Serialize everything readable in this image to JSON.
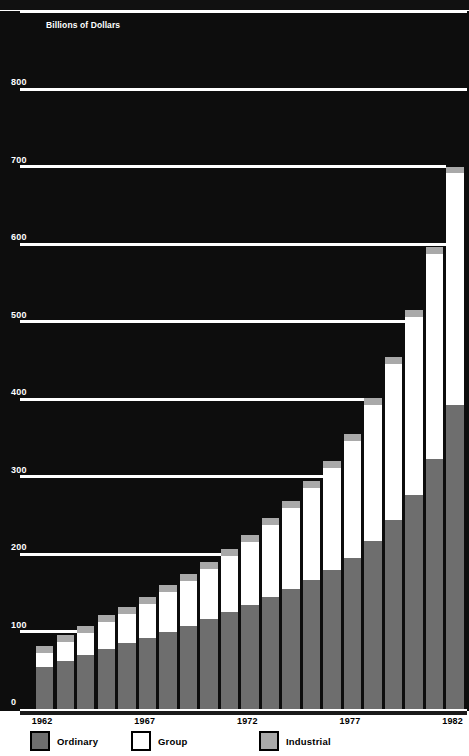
{
  "axis_unit_label": "Billions of Dollars",
  "colors": {
    "ordinary": "#6e6e6e",
    "group": "#ffffff",
    "industrial": "#a9a9a9",
    "plot_background": "#0d0d0d",
    "gridline": "#ffffff"
  },
  "yticks": [
    "900",
    "800",
    "700",
    "600",
    "500",
    "400",
    "300",
    "200",
    "100",
    "0"
  ],
  "xticks": [
    "1962",
    "1967",
    "1972",
    "1977",
    "1982"
  ],
  "legend": [
    {
      "label": "Ordinary",
      "swatch": "#6e6e6e",
      "key": "ordinary"
    },
    {
      "label": "Group",
      "swatch": "#ffffff",
      "key": "group"
    },
    {
      "label": "Industrial",
      "swatch": "#a9a9a9",
      "key": "industrial"
    }
  ],
  "chart_data": {
    "type": "bar",
    "title": "",
    "subtitle": "",
    "xlabel": "",
    "ylabel": "Billions of Dollars",
    "ylim": [
      0,
      900
    ],
    "yticks": [
      0,
      100,
      200,
      300,
      400,
      500,
      600,
      700,
      800,
      900
    ],
    "grid": true,
    "stacked": true,
    "legend_position": "bottom",
    "categories": [
      "1962",
      "1963",
      "1964",
      "1965",
      "1966",
      "1967",
      "1968",
      "1969",
      "1970",
      "1971",
      "1972",
      "1973",
      "1974",
      "1975",
      "1976",
      "1977",
      "1978",
      "1979",
      "1980",
      "1981",
      "1982"
    ],
    "series": [
      {
        "name": "Ordinary",
        "color": "#6e6e6e",
        "values": [
          54,
          62,
          70,
          78,
          85,
          91,
          99,
          107,
          116,
          125,
          134,
          144,
          155,
          167,
          179,
          195,
          217,
          244,
          276,
          323,
          392
        ]
      },
      {
        "name": "Group",
        "color": "#ffffff",
        "values": [
          18,
          24,
          28,
          34,
          38,
          45,
          52,
          58,
          65,
          73,
          81,
          93,
          105,
          118,
          132,
          151,
          175,
          201,
          230,
          264,
          299
        ]
      },
      {
        "name": "Industrial",
        "color": "#a9a9a9",
        "values": [
          9,
          9,
          9,
          9,
          9,
          9,
          9,
          9,
          9,
          9,
          9,
          9,
          9,
          9,
          9,
          9,
          9,
          9,
          9,
          9,
          9
        ]
      }
    ],
    "totals": [
      81,
      95,
      107,
      121,
      132,
      145,
      160,
      174,
      190,
      207,
      224,
      246,
      269,
      294,
      320,
      355,
      401,
      454,
      515,
      596,
      700
    ]
  }
}
